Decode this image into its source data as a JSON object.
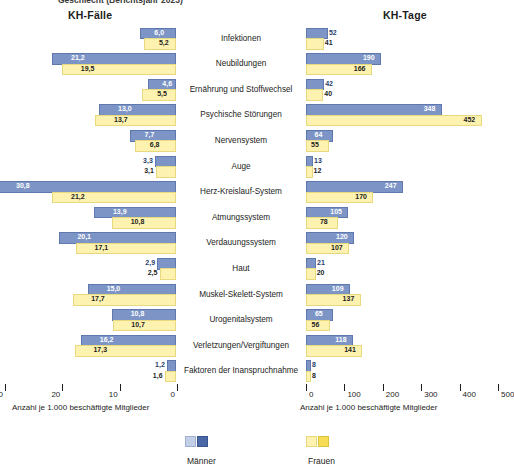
{
  "cropped_title": "Geschlecht (Berichtsjahr 2023)",
  "panels": {
    "left_header": "KH-Fälle",
    "right_header": "KH-Tage"
  },
  "axis": {
    "left_ticks": [
      "30",
      "20",
      "10",
      "0"
    ],
    "right_ticks": [
      "0",
      "100",
      "200",
      "300",
      "400",
      "500"
    ],
    "left_caption": "Anzahl je 1.000 beschäftigte Mitglieder",
    "right_caption": "Anzahl je 1.000 beschäftigte Mitglieder"
  },
  "legend": {
    "men": "Männer",
    "women": "Frauen"
  },
  "colors": {
    "men_bar": "#7d95c6",
    "women_bar": "#fdf2b0",
    "men_legend_light": "#c3cfe6",
    "men_legend_dark": "#4a68a8",
    "women_legend_light": "#fdf2b0",
    "women_legend_dark": "#f7dd55"
  },
  "chart_data": {
    "type": "bar",
    "title": "Geschlecht (Berichtsjahr 2023)",
    "orientation": "horizontal",
    "layout": "back-to-back paired panels",
    "categories": [
      "Infektionen",
      "Neubildungen",
      "Ernährung und Stoffwechsel",
      "Psychische Störungen",
      "Nervensystem",
      "Auge",
      "Herz-Kreislauf-System",
      "Atmungssystem",
      "Verdauungssystem",
      "Haut",
      "Muskel-Skelett-System",
      "Urogenitalsystem",
      "Verletzungen/Vergiftungen",
      "Faktoren der Inanspruchnahme"
    ],
    "panels": [
      {
        "name": "KH-Fälle",
        "xlabel": "Anzahl je 1.000 beschäftigte Mitglieder",
        "xlim": [
          0,
          30
        ],
        "direction": "right-to-left",
        "ticks": [
          30,
          20,
          10,
          0
        ],
        "series": [
          {
            "name": "Männer",
            "values": [
              6.0,
              21.2,
              4.6,
              13.0,
              7.7,
              3.3,
              30.8,
              13.9,
              20.1,
              2.9,
              15.0,
              10.8,
              16.2,
              1.2
            ],
            "labels": [
              "6,0",
              "21,2",
              "4,6",
              "13,0",
              "7,7",
              "3,3",
              "30,8",
              "13,9",
              "20,1",
              "2,9",
              "15,0",
              "10,8",
              "16,2",
              "1,2"
            ]
          },
          {
            "name": "Frauen",
            "values": [
              5.2,
              19.5,
              5.5,
              13.7,
              6.8,
              3.1,
              21.2,
              10.8,
              17.1,
              2.5,
              17.7,
              10.7,
              17.3,
              1.6
            ],
            "labels": [
              "5,2",
              "19,5",
              "5,5",
              "13,7",
              "6,8",
              "3,1",
              "21,2",
              "10,8",
              "17,1",
              "2,5",
              "17,7",
              "10,7",
              "17,3",
              "1,6"
            ]
          }
        ]
      },
      {
        "name": "KH-Tage",
        "xlabel": "Anzahl je 1.000 beschäftigte Mitglieder",
        "xlim": [
          0,
          500
        ],
        "direction": "left-to-right",
        "ticks": [
          0,
          100,
          200,
          300,
          400,
          500
        ],
        "series": [
          {
            "name": "Männer",
            "values": [
              52,
              190,
              42,
              348,
              64,
              13,
              247,
              105,
              120,
              21,
              109,
              65,
              118,
              8
            ],
            "labels": [
              "52",
              "190",
              "42",
              "348",
              "64",
              "13",
              "247",
              "105",
              "120",
              "21",
              "109",
              "65",
              "118",
              "8"
            ]
          },
          {
            "name": "Frauen",
            "values": [
              41,
              166,
              40,
              452,
              55,
              12,
              170,
              78,
              107,
              20,
              137,
              56,
              141,
              8
            ],
            "labels": [
              "41",
              "166",
              "40",
              "452",
              "55",
              "12",
              "170",
              "78",
              "107",
              "20",
              "137",
              "56",
              "141",
              "8"
            ]
          }
        ]
      }
    ],
    "grid": false,
    "legend_position": "bottom-center"
  }
}
